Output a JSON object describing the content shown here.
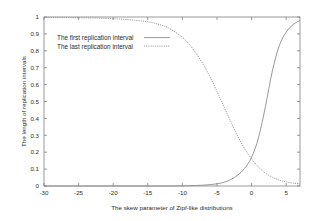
{
  "chart_data": {
    "type": "line",
    "title": "",
    "xlabel": "The skew parameter of Zipf-like distributions",
    "ylabel": "The length of replication intervals",
    "xlim": [
      -30,
      7
    ],
    "ylim": [
      0,
      1
    ],
    "grid": false,
    "legend_position": "top-left-inside",
    "xticks": [
      -30,
      -25,
      -20,
      -15,
      -10,
      -5,
      0,
      5
    ],
    "xtick_labels": [
      "-30",
      "-25",
      "-20",
      "-15",
      "-10",
      "-5",
      "0",
      "5"
    ],
    "yticks": [
      0,
      0.1,
      0.2,
      0.3,
      0.4,
      0.5,
      0.6,
      0.7,
      0.8,
      0.9,
      1
    ],
    "ytick_labels": [
      "0",
      "0.1",
      "0.2",
      "0.3",
      "0.4",
      "0.5",
      "0.6",
      "0.7",
      "0.8",
      "0.9",
      "1"
    ],
    "x": [
      -30,
      -28,
      -26,
      -24,
      -22,
      -20,
      -18,
      -16,
      -14,
      -12,
      -10,
      -9,
      -8,
      -7,
      -6,
      -5,
      -4,
      -3,
      -2,
      -1,
      0,
      1,
      2,
      3,
      4,
      5,
      6,
      7
    ],
    "series": [
      {
        "name": "The first replication interval",
        "style": "solid",
        "color": "#8c8c8c",
        "values": [
          0.0,
          0.0,
          0.0,
          0.0,
          0.0,
          0.0,
          0.0,
          0.0,
          0.0,
          0.0,
          0.001,
          0.002,
          0.003,
          0.005,
          0.008,
          0.013,
          0.022,
          0.038,
          0.065,
          0.105,
          0.17,
          0.285,
          0.47,
          0.68,
          0.83,
          0.91,
          0.955,
          0.98
        ]
      },
      {
        "name": "The last replication interval",
        "style": "dotted",
        "color": "#8c8c8c",
        "values": [
          0.998,
          0.997,
          0.996,
          0.995,
          0.993,
          0.99,
          0.985,
          0.977,
          0.963,
          0.935,
          0.88,
          0.838,
          0.785,
          0.72,
          0.645,
          0.56,
          0.47,
          0.38,
          0.295,
          0.22,
          0.16,
          0.112,
          0.076,
          0.052,
          0.035,
          0.024,
          0.017,
          0.012
        ]
      }
    ]
  },
  "legend": {
    "entries": [
      {
        "label": "The first replication interval",
        "style": "solid"
      },
      {
        "label": "The last replication interval",
        "style": "dotted"
      }
    ]
  }
}
